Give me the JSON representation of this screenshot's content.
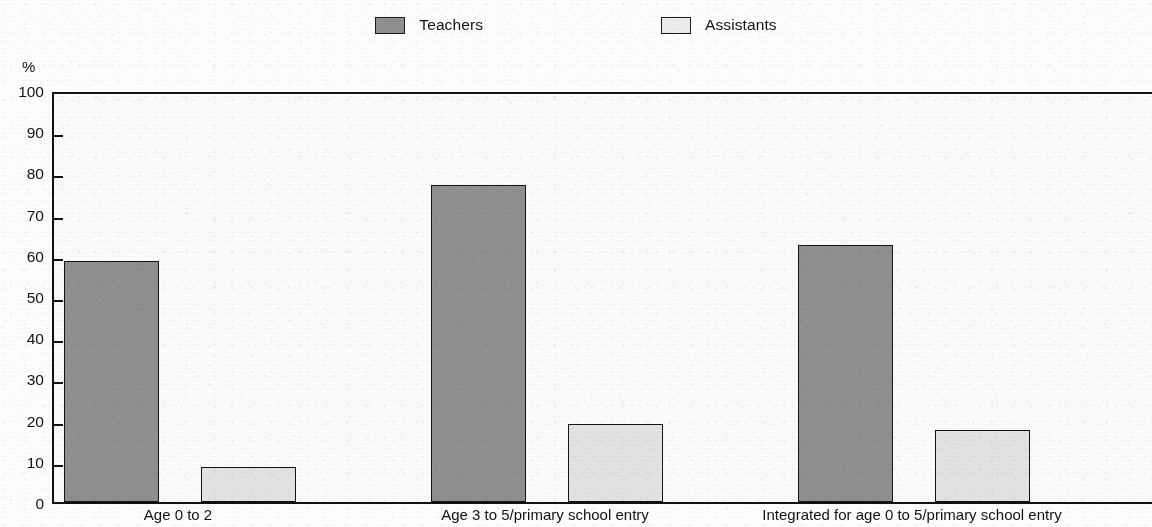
{
  "legend": {
    "entries": [
      {
        "label": "Teachers",
        "color": "#8f8f8f",
        "icon": "legend-swatch-filled"
      },
      {
        "label": "Assistants",
        "color": "#e2e2e2",
        "icon": "legend-swatch-outline"
      }
    ]
  },
  "axis": {
    "y_unit": "%",
    "ticks": [
      "100",
      "90",
      "80",
      "70",
      "60",
      "50",
      "40",
      "30",
      "20",
      "10",
      "0"
    ]
  },
  "chart_data": {
    "type": "bar",
    "title": "",
    "subtitle": "",
    "xlabel": "",
    "ylabel": "%",
    "ylim": [
      0,
      100
    ],
    "y_ticks": [
      0,
      10,
      20,
      30,
      40,
      50,
      60,
      70,
      80,
      90,
      100
    ],
    "grid": false,
    "legend_position": "top-center",
    "categories": [
      "Age 0 to 2",
      "Age 3 to 5/primary school entry",
      "Integrated for age 0 to 5/primary school entry"
    ],
    "series": [
      {
        "name": "Teachers",
        "color": "#8f8f8f",
        "values": [
          58.5,
          77.0,
          62.5
        ]
      },
      {
        "name": "Assistants",
        "color": "#e2e2e2",
        "values": [
          8.5,
          19.0,
          17.5
        ]
      }
    ]
  }
}
